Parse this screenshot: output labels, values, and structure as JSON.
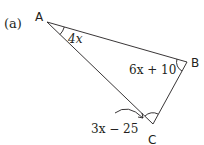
{
  "part_label": "(a)",
  "vertices": {
    "A": "A",
    "B": "B",
    "C": "C"
  },
  "angles": {
    "A": "4x",
    "B": "6x + 10",
    "C": "3x − 25"
  },
  "colors": {
    "line": "#231f20",
    "background": "#ffffff"
  }
}
